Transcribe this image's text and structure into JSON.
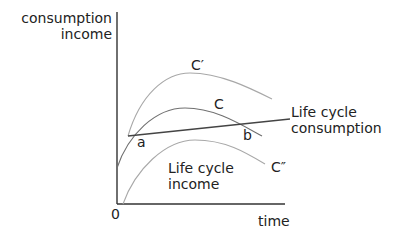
{
  "diagram": {
    "y_axis_label_line1": "consumption",
    "y_axis_label_line2": "income",
    "x_axis_label": "time",
    "origin_label": "0",
    "curves": [
      {
        "name": "C'",
        "label": "C′"
      },
      {
        "name": "C",
        "label": "C"
      },
      {
        "name": "C''",
        "label": "C″"
      }
    ],
    "consumption_line_label_line1": "Life cycle",
    "consumption_line_label_line2": "consumption",
    "income_label_line1": "Life cycle",
    "income_label_line2": "income",
    "point_a": "a",
    "point_b": "b",
    "colors": {
      "axis": "#333333",
      "income_curves": "#9a9a9a",
      "income_curve_C": "#6e6e6e",
      "consumption_line": "#444444"
    }
  }
}
